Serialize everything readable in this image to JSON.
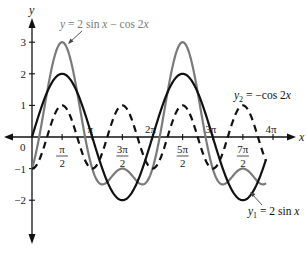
{
  "chart_data": {
    "type": "line",
    "title": "",
    "xlabel": "x",
    "ylabel": "y",
    "xlim": [
      0,
      12.566
    ],
    "ylim": [
      -2.6,
      3.6
    ],
    "grid": false,
    "x_ticks": [
      {
        "value": 1.5708,
        "label_num": "π",
        "label_den": "2",
        "position": "below"
      },
      {
        "value": 3.1416,
        "label": "π",
        "position": "above"
      },
      {
        "value": 4.7124,
        "label_num": "3π",
        "label_den": "2",
        "position": "below"
      },
      {
        "value": 6.2832,
        "label": "2π",
        "position": "above"
      },
      {
        "value": 7.854,
        "label_num": "5π",
        "label_den": "2",
        "position": "below"
      },
      {
        "value": 9.4248,
        "label": "3π",
        "position": "above"
      },
      {
        "value": 10.9956,
        "label_num": "7π",
        "label_den": "2",
        "position": "below"
      },
      {
        "value": 12.5664,
        "label": "4π",
        "position": "above"
      }
    ],
    "y_ticks": [
      {
        "value": 3,
        "label": "3"
      },
      {
        "value": 2,
        "label": "2"
      },
      {
        "value": 1,
        "label": "1"
      },
      {
        "value": -1,
        "label": "−1"
      },
      {
        "value": -2,
        "label": "−2"
      }
    ],
    "origin_label": "0",
    "series": [
      {
        "name": "y = 2 sin x − cos 2x",
        "expression": "2*sin(x) - cos(2*x)",
        "style": "solid",
        "color": "#7a7a7a",
        "x_range": [
          0,
          12.2
        ]
      },
      {
        "name": "y₁ = 2 sin x",
        "expression": "2*sin(x)",
        "style": "solid",
        "color": "#111111",
        "x_range": [
          0,
          12.2
        ]
      },
      {
        "name": "y₂ = −cos 2x",
        "expression": "-cos(2*x)",
        "style": "dashed",
        "color": "#111111",
        "x_range": [
          0,
          12.2
        ]
      }
    ],
    "annotations": [
      {
        "text_parts": [
          "y",
          " = 2 sin ",
          "x",
          " − cos 2",
          "x"
        ],
        "color": "#7a7a7a",
        "points_to": "peak near x=π/2, y=3"
      },
      {
        "text_parts": [
          "y",
          "2",
          " = −cos 2",
          "x"
        ],
        "color": "#111111",
        "points_to": "dashed curve peak near x=7π/2"
      },
      {
        "text_parts": [
          "y",
          "1",
          " = 2 sin ",
          "x"
        ],
        "color": "#111111",
        "points_to": "black curve minimum near x=7π/2"
      }
    ]
  }
}
